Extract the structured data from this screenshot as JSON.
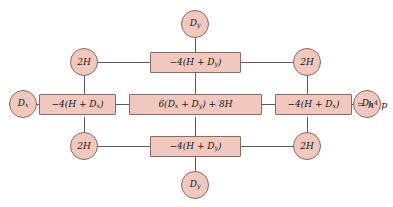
{
  "figure": {
    "type": "computational-stencil-diagram",
    "clipped_header_text": "",
    "colors": {
      "node_fill": "#f0c8bd",
      "node_border": "#8a6a62",
      "edge": "#5a5a5e",
      "text": "#17171d",
      "background": "#ffffff"
    }
  },
  "nodes": {
    "top_circle": {
      "label": "D",
      "sub": "y"
    },
    "bottom_circle": {
      "label": "D",
      "sub": "y"
    },
    "left_circle": {
      "label": "D",
      "sub": "x"
    },
    "right_circle": {
      "label": "D",
      "sub": "x"
    },
    "corner_top_left": {
      "label": "2H"
    },
    "corner_top_right": {
      "label": "2H"
    },
    "corner_bottom_left": {
      "label": "2H"
    },
    "corner_bottom_right": {
      "label": "2H"
    },
    "box_top": {
      "prefix": "−4(H + D",
      "sub": "y",
      "suffix": ")"
    },
    "box_bottom": {
      "prefix": "−4(H + D",
      "sub": "y",
      "suffix": ")"
    },
    "box_left": {
      "prefix": "−4(H + D",
      "sub": "x",
      "suffix": ")"
    },
    "box_right": {
      "prefix": "−4(H + D",
      "sub": "x",
      "suffix": ")"
    },
    "box_center": {
      "p1": "6(D",
      "s1": "x",
      "p2": " + D",
      "s2": "y",
      "p3": ") + 8H"
    }
  },
  "annotation": {
    "equals": "= h",
    "exponent": "4",
    "variable": " p"
  }
}
